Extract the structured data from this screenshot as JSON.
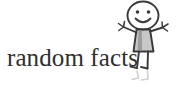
{
  "logo": {
    "wordmark_text": "random facts",
    "text_color": "#2f2f2f",
    "background_color": "#ffffff",
    "illustration": {
      "name": "stick-figure-girl",
      "description": "hand-drawn smiling stick figure girl in a dress with arms outstretched",
      "line_color": "#3a3a3a",
      "dress_fill_color": "#9a9a9a",
      "reflection_color": "#c9c9c9",
      "parts": [
        "head-circle",
        "left-eye",
        "right-eye",
        "smile",
        "dress-body",
        "left-arm",
        "right-arm",
        "left-hand",
        "right-hand",
        "left-leg",
        "right-leg",
        "left-foot",
        "right-foot",
        "reflection"
      ]
    }
  }
}
